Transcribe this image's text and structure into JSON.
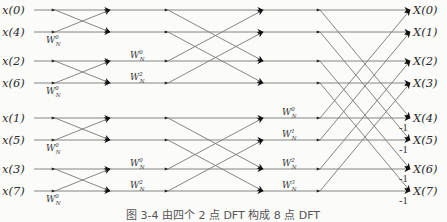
{
  "diagram": {
    "type": "radix-2 DIT FFT butterfly flow graph",
    "inputs": [
      "x(0)",
      "x(4)",
      "x(2)",
      "x(6)",
      "x(1)",
      "x(5)",
      "x(3)",
      "x(7)"
    ],
    "outputs": [
      "X(0)",
      "X(1)",
      "X(2)",
      "X(3)",
      "X(4)",
      "X(5)",
      "X(6)",
      "X(7)"
    ],
    "row_y": [
      10,
      32,
      61,
      83,
      118,
      140,
      169,
      191
    ],
    "stages": [
      {
        "name": "stage-1",
        "twiddles": [
          {
            "row": 1,
            "base": "W",
            "sub": "N",
            "sup": "0"
          },
          {
            "row": 3,
            "base": "W",
            "sub": "N",
            "sup": "0"
          },
          {
            "row": 5,
            "base": "W",
            "sub": "N",
            "sup": "0"
          },
          {
            "row": 7,
            "base": "W",
            "sub": "N",
            "sup": "0"
          }
        ]
      },
      {
        "name": "stage-2",
        "twiddles": [
          {
            "row": 2,
            "base": "W",
            "sub": "N",
            "sup": "0"
          },
          {
            "row": 3,
            "base": "W",
            "sub": "N",
            "sup": "2"
          },
          {
            "row": 6,
            "base": "W",
            "sub": "N",
            "sup": "0"
          },
          {
            "row": 7,
            "base": "W",
            "sub": "N",
            "sup": "2"
          }
        ]
      },
      {
        "name": "stage-3",
        "twiddles": [
          {
            "row": 4,
            "base": "W",
            "sub": "N",
            "sup": "0"
          },
          {
            "row": 5,
            "base": "W",
            "sub": "N",
            "sup": "1"
          },
          {
            "row": 6,
            "base": "W",
            "sub": "N",
            "sup": "2"
          },
          {
            "row": 7,
            "base": "W",
            "sub": "N",
            "sup": "3"
          }
        ]
      }
    ],
    "neg_one_label": "-1",
    "neg_one_rows": [
      4,
      5,
      6,
      7
    ]
  },
  "caption": "图 3-4   由四个 2 点 DFT 构成 8 点 DFT"
}
